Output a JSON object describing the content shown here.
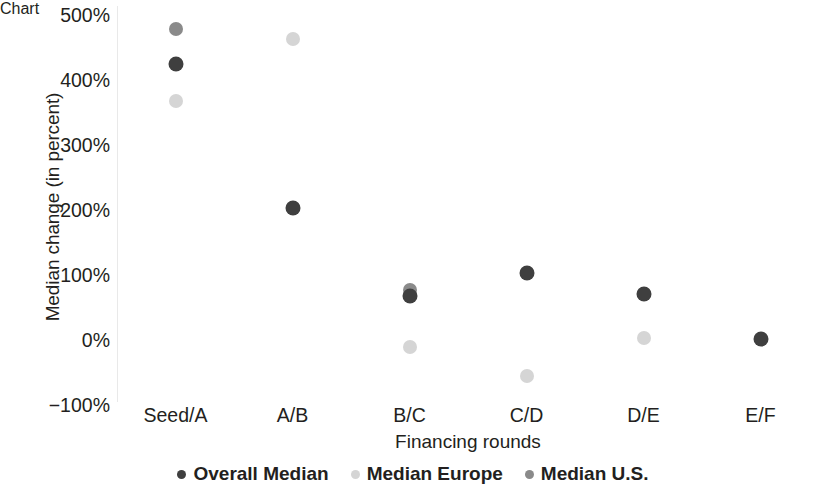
{
  "chart_data": {
    "type": "scatter",
    "title": "",
    "xlabel": "Financing rounds",
    "ylabel": "Median change (in percent)",
    "categories": [
      "Seed/A",
      "A/B",
      "B/C",
      "C/D",
      "D/E",
      "E/F"
    ],
    "ytick_labels": [
      "500%",
      "400%",
      "300%",
      "200%",
      "100%",
      "0%",
      "−100%"
    ],
    "ytick_values": [
      500,
      400,
      300,
      200,
      100,
      0,
      -100
    ],
    "ylim": [
      -100,
      500
    ],
    "grid": false,
    "legend_position": "bottom",
    "series": [
      {
        "name": "Overall Median",
        "color": "#3f3f3f",
        "values": [
          425,
          203,
          67,
          103,
          71,
          2
        ]
      },
      {
        "name": "Median Europe",
        "color": "#d5d5d5",
        "values": [
          367,
          463,
          -11,
          -55,
          3,
          null
        ]
      },
      {
        "name": "Median U.S.",
        "color": "#8a8a8a",
        "values": [
          478,
          203,
          77,
          103,
          71,
          null
        ]
      }
    ]
  }
}
